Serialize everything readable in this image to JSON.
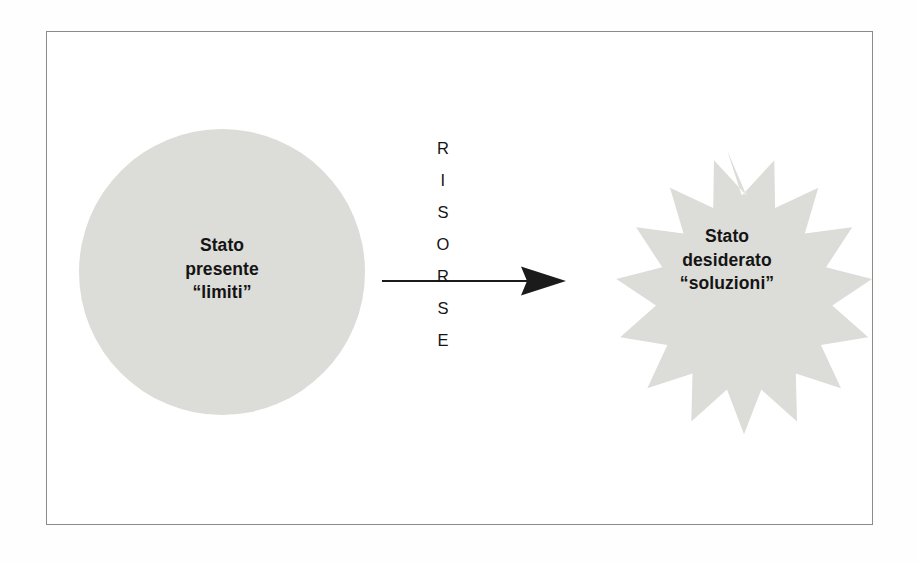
{
  "diagram": {
    "frame": {
      "name": "outer-frame",
      "border_color": "#8b8b89"
    },
    "colors": {
      "shape_fill": "#dcdcd8",
      "text": "#141414",
      "arrow": "#1b1b1b",
      "frame_border": "#8b8b89",
      "background": "#ffffff"
    },
    "left_shape": {
      "type": "circle",
      "shape_name": "circle",
      "fill": "#dcdcd8",
      "label_lines": [
        "Stato",
        "presente",
        "“limiti”"
      ],
      "label_text": "Stato\npresente\n“limiti”"
    },
    "right_shape": {
      "type": "starburst",
      "shape_name": "star",
      "points": 16,
      "fill": "#dcdcd8",
      "label_lines": [
        "Stato",
        "desiderato",
        "“soluzioni”"
      ],
      "label_text": "Stato\ndesiderato\n“soluzioni”"
    },
    "connector": {
      "type": "arrow",
      "direction": "left-to-right",
      "color": "#1b1b1b"
    },
    "vertical_word": {
      "text": "RISORSE",
      "letters": [
        "R",
        "I",
        "S",
        "O",
        "R",
        "S",
        "E"
      ],
      "orientation": "vertical"
    }
  }
}
